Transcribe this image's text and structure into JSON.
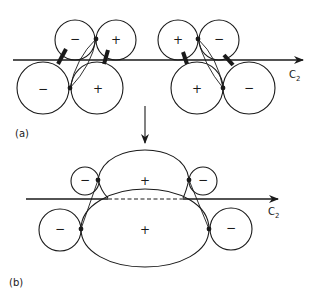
{
  "figure": {
    "panel_a": {
      "label": "(a)",
      "axis_label_main": "C",
      "axis_label_sub": "2",
      "left_group": {
        "top_left_sign": "−",
        "top_right_sign": "+",
        "bottom_left_sign": "−",
        "bottom_right_sign": "+"
      },
      "right_group": {
        "top_left_sign": "+",
        "top_right_sign": "−",
        "bottom_left_sign": "+",
        "bottom_right_sign": "−"
      }
    },
    "transition_arrow": "down-arrow",
    "panel_b": {
      "label": "(b)",
      "axis_label_main": "C",
      "axis_label_sub": "2",
      "upper_lobe_sign": "+",
      "lower_lobe_sign": "+",
      "upper_left_circle_sign": "−",
      "upper_right_circle_sign": "−",
      "lower_left_circle_sign": "−",
      "lower_right_circle_sign": "−"
    },
    "colors": {
      "ink": "#1a1a1a",
      "background": "#ffffff"
    }
  }
}
